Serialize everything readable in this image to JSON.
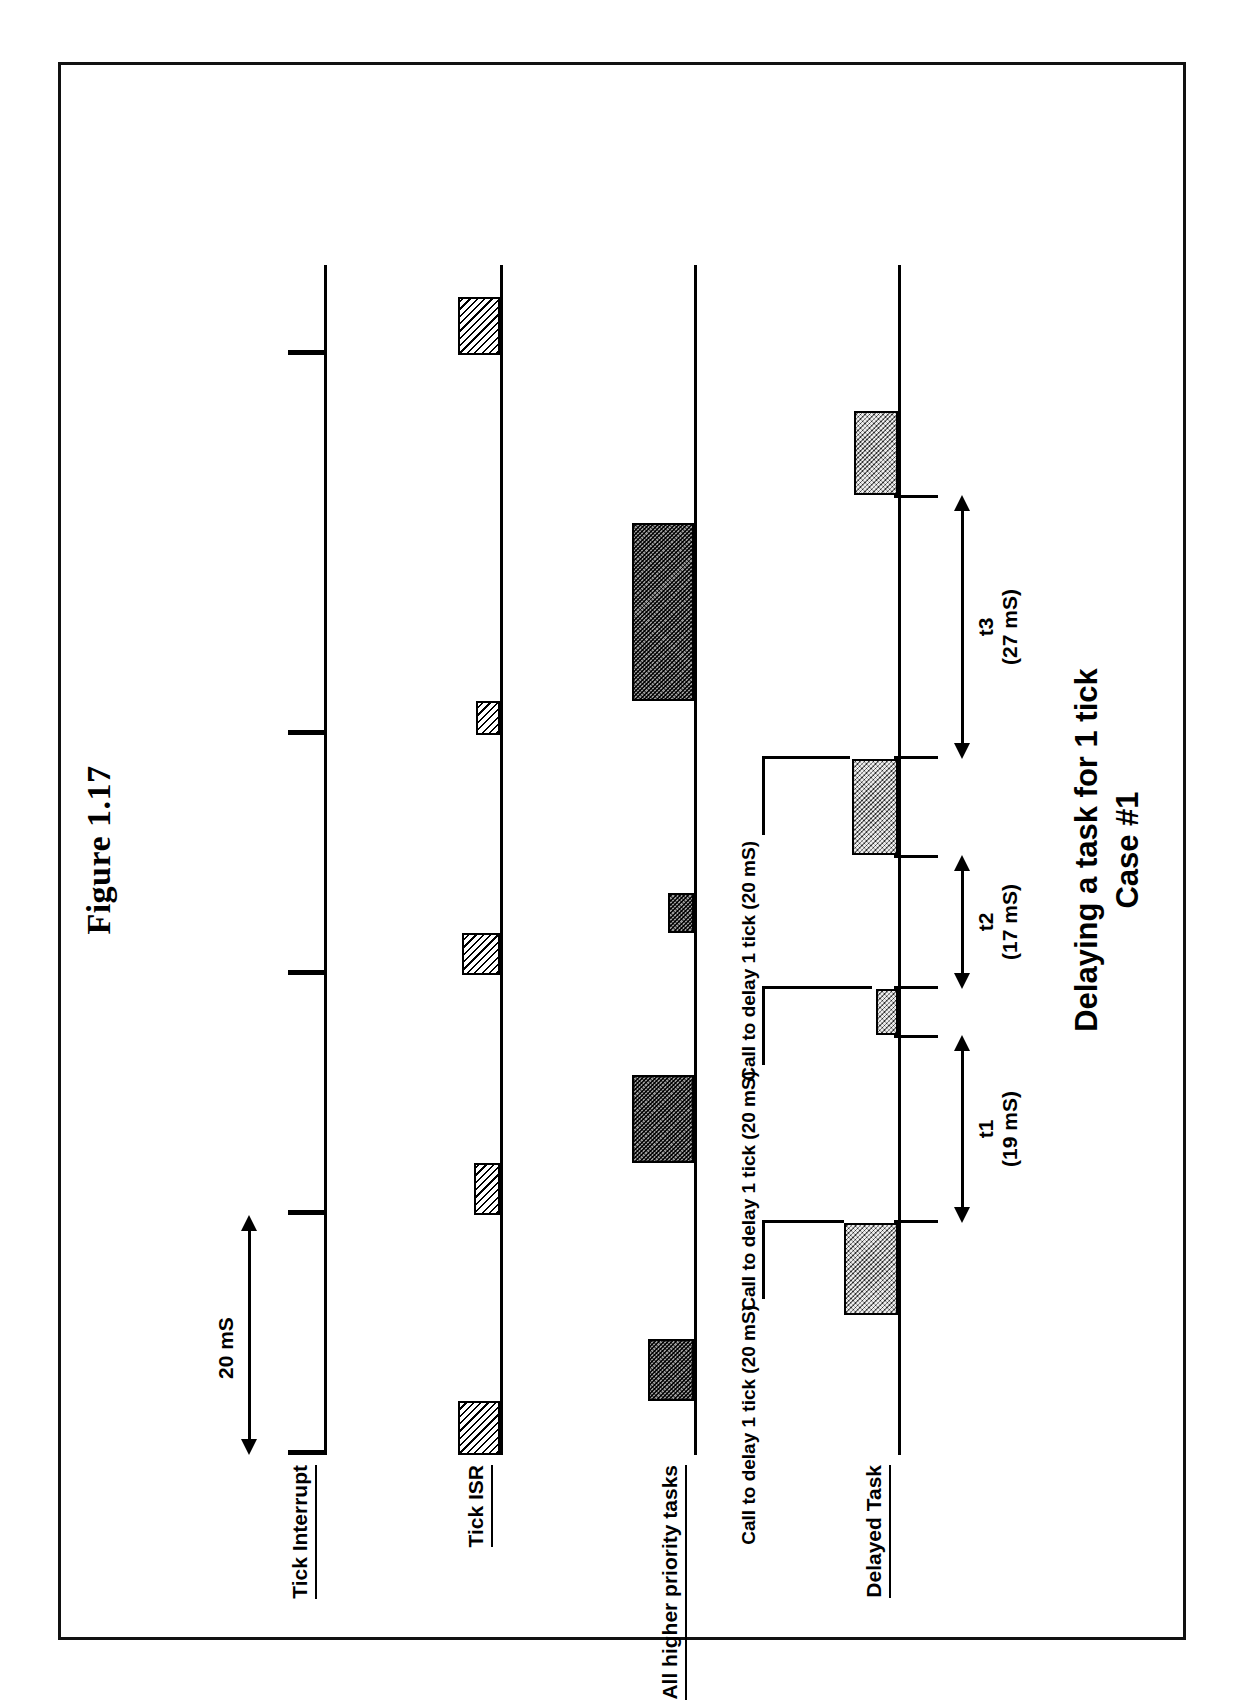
{
  "figure": {
    "caption": "Figure 1.17",
    "title_line1": "Delaying a task for 1 tick",
    "title_line2": "Case #1"
  },
  "lanes": [
    {
      "id": "tick-interrupt",
      "label": "Tick Interrupt"
    },
    {
      "id": "tick-isr",
      "label": "Tick ISR"
    },
    {
      "id": "higher-priority-tasks",
      "label": "All higher priority tasks"
    },
    {
      "id": "delayed-task",
      "label": "Delayed Task"
    }
  ],
  "tick_period": {
    "label": "20 mS",
    "value": 20,
    "unit": "mS"
  },
  "tick_marks": [
    {
      "index": 0,
      "x": 0
    },
    {
      "index": 1,
      "x": 240
    },
    {
      "index": 2,
      "x": 480
    },
    {
      "index": 3,
      "x": 720
    },
    {
      "index": 4,
      "x": 1100
    }
  ],
  "tick_isr_blocks": [
    {
      "x": 0,
      "w": 54
    },
    {
      "x": 240,
      "w": 52
    },
    {
      "x": 480,
      "w": 42
    },
    {
      "x": 720,
      "w": 34
    },
    {
      "x": 1100,
      "w": 58
    }
  ],
  "higher_priority_blocks": [
    {
      "x": 54,
      "w": 62,
      "shade": "dark"
    },
    {
      "x": 292,
      "w": 88,
      "shade": "dark"
    },
    {
      "x": 522,
      "w": 40,
      "shade": "dark"
    },
    {
      "x": 754,
      "w": 178,
      "shade": "dark"
    }
  ],
  "delayed_task_blocks": [
    {
      "x": 140,
      "w": 92,
      "shade": "grey"
    },
    {
      "x": 420,
      "w": 46,
      "shade": "grey"
    },
    {
      "x": 600,
      "w": 96,
      "shade": "grey"
    },
    {
      "x": 960,
      "w": 84,
      "shade": "grey"
    }
  ],
  "callouts": [
    {
      "id": "callout-1",
      "text": "Call to delay 1 tick (20 mS)",
      "anchor_x": 232
    },
    {
      "id": "callout-2",
      "text": "Call to delay 1 tick (20 mS)",
      "anchor_x": 466
    },
    {
      "id": "callout-3",
      "text": "Call to delay 1 tick (20 mS)",
      "anchor_x": 696
    }
  ],
  "measurements": [
    {
      "id": "t1",
      "name": "t1",
      "value_label": "(19 mS)",
      "value": 19,
      "unit": "mS",
      "from_x": 232,
      "to_x": 420
    },
    {
      "id": "t2",
      "name": "t2",
      "value_label": "(17 mS)",
      "value": 17,
      "unit": "mS",
      "from_x": 466,
      "to_x": 600
    },
    {
      "id": "t3",
      "name": "t3",
      "value_label": "(27 mS)",
      "value": 27,
      "unit": "mS",
      "from_x": 696,
      "to_x": 960
    }
  ],
  "colors": {
    "ink": "#000000",
    "paper": "#ffffff",
    "block_dark": "#4a4a4a",
    "block_grey": "#a9a9a9"
  }
}
